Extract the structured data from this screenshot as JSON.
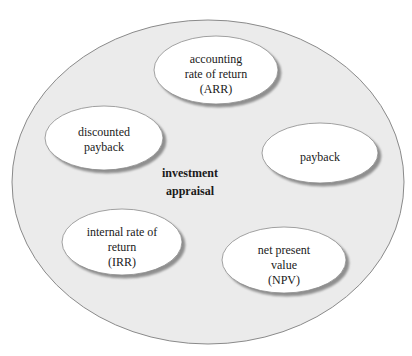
{
  "diagram": {
    "type": "concept-cluster",
    "colors": {
      "outer_fill": "#ebebeb",
      "outer_stroke": "#8a8a8a",
      "node_fill": "#ffffff",
      "node_stroke": "#8a8a8a",
      "node_shadow": "#9a9a9a",
      "text": "#1a1a1a"
    },
    "center": {
      "lines": [
        "investment",
        "appraisal"
      ]
    },
    "nodes": [
      {
        "id": "arr",
        "lines": [
          "accounting",
          "rate of return",
          "(ARR)"
        ]
      },
      {
        "id": "discounted-payback",
        "lines": [
          "discounted",
          "payback"
        ]
      },
      {
        "id": "payback",
        "lines": [
          "payback"
        ]
      },
      {
        "id": "irr",
        "lines": [
          "internal rate of",
          "return",
          "(IRR)"
        ]
      },
      {
        "id": "npv",
        "lines": [
          "net present",
          "value",
          "(NPV)"
        ]
      }
    ]
  }
}
